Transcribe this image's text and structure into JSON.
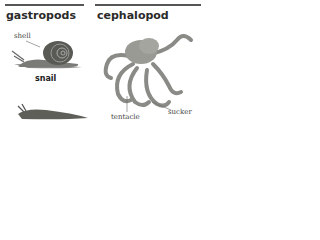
{
  "columns": [
    {
      "heading": "gastropods",
      "labels": {
        "shell": "shell"
      },
      "examples": [
        {
          "name": "snail"
        },
        {
          "name": ""
        }
      ]
    },
    {
      "heading": "cephalopod",
      "labels": {
        "tentacle": "tentacle",
        "sucker": "sucker"
      }
    }
  ]
}
